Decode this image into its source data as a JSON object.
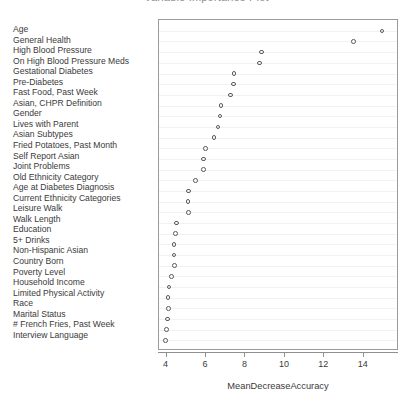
{
  "chart_data": {
    "type": "scatter",
    "title": "Variable Importance Plot",
    "xlabel": "MeanDecreaseAccuracy",
    "ylabel": "",
    "xlim": [
      3.62,
      15.78
    ],
    "ylim": [
      0,
      31
    ],
    "grid": true,
    "legend": null,
    "x_ticks": [
      4,
      6,
      8,
      10,
      12,
      14
    ],
    "x_tick_labels": [
      "4",
      "6",
      "8",
      "10",
      "12",
      "14"
    ],
    "categories": [
      "Age",
      "General Health",
      "High Blood Pressure",
      "On High Blood Pressure Meds",
      "Gestational Diabetes",
      "Pre-Diabetes",
      "Fast Food, Past Week",
      "Asian, CHPR Definition",
      "Gender",
      "Lives with Parent",
      "Asian Subtypes",
      "Fried Potatoes, Past Month",
      "Self Report Asian",
      "Joint Problems",
      "Old Ethnicity Category",
      "Age at Diabetes Diagnosis",
      "Current Ethnicity Categories",
      "Leisure Walk",
      "Walk Length",
      "Education",
      "5+ Drinks",
      "Non-Hispanic Asian",
      "Country Born",
      "Poverty Level",
      "Household Income",
      "Limited Physical Activity",
      "Race",
      "Marital Status",
      "# French Fries, Past Week",
      "Interview Language"
    ],
    "values": [
      14.92,
      13.48,
      8.81,
      8.71,
      7.43,
      7.39,
      7.24,
      6.77,
      6.72,
      6.6,
      6.41,
      5.97,
      5.87,
      5.86,
      5.48,
      5.11,
      5.08,
      5.1,
      4.51,
      4.46,
      4.39,
      4.39,
      4.41,
      4.24,
      4.12,
      4.07,
      4.09,
      4.05,
      4.0,
      3.96
    ],
    "marker": "open-circle",
    "marker_color": "#5b5b5b"
  },
  "axis": {
    "x_title": "MeanDecreaseAccuracy"
  },
  "title_text": ""
}
